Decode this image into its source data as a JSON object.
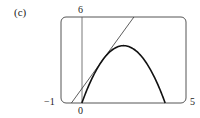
{
  "chart_data": {
    "type": "line",
    "title": "(c)",
    "xlabel": "",
    "ylabel": "",
    "xlim": [
      -1,
      5
    ],
    "ylim": [
      0,
      6
    ],
    "grid": false,
    "legend": null,
    "x_tick_labels": [
      "-1",
      "0",
      "5"
    ],
    "y_tick_labels": [
      "6"
    ],
    "series": [
      {
        "name": "parabola",
        "expression": "y = 4x - x^2",
        "style": "thick",
        "x": [
          0,
          0.5,
          1,
          1.5,
          2,
          2.5,
          3,
          3.5,
          4
        ],
        "y": [
          0,
          1.75,
          3,
          3.75,
          4,
          3.75,
          3,
          1.75,
          0
        ]
      },
      {
        "name": "tangent line",
        "expression": "y = 2x + 1",
        "style": "thin",
        "x": [
          -0.5,
          2.5
        ],
        "y": [
          0,
          6
        ]
      }
    ],
    "annotations": [
      {
        "type": "tangent_point",
        "x": 1,
        "y": 3
      }
    ]
  },
  "labels": {
    "panel": "(c)",
    "x_min": "−1",
    "x_zero": "0",
    "x_max": "5",
    "y_max": "6"
  },
  "colors": {
    "stroke": "#222222",
    "frame": "#555555",
    "background": "#ffffff"
  }
}
